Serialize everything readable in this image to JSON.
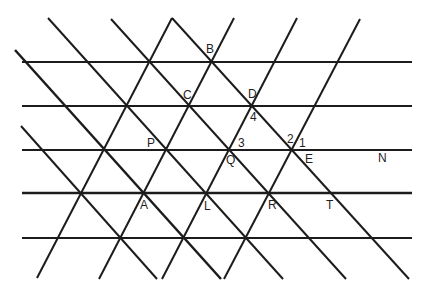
{
  "canvas": {
    "width": 428,
    "height": 297,
    "background": "#ffffff",
    "stroke_color": "#1c1c1c",
    "label_color": "#1e1e1e"
  },
  "diagram": {
    "horizontal_lines": [
      {
        "id": "row-0",
        "x1": 22,
        "y1": 62,
        "x2": 412,
        "y2": 62,
        "width": 2
      },
      {
        "id": "row-1",
        "x1": 22,
        "y1": 106,
        "x2": 412,
        "y2": 106,
        "width": 2
      },
      {
        "id": "row-2",
        "x1": 22,
        "y1": 150,
        "x2": 412,
        "y2": 150,
        "width": 2
      },
      {
        "id": "row-3",
        "x1": 22,
        "y1": 193,
        "x2": 412,
        "y2": 193,
        "width": 2.6
      },
      {
        "id": "row-4",
        "x1": 22,
        "y1": 238,
        "x2": 412,
        "y2": 238,
        "width": 2
      }
    ],
    "descending_lines": [
      {
        "id": "desc-0",
        "x1": 21,
        "y1": 126,
        "x2": 157,
        "y2": 279,
        "width": 2
      },
      {
        "id": "desc-1",
        "x1": 15,
        "y1": 50,
        "x2": 221,
        "y2": 279,
        "width": 2.5
      },
      {
        "id": "desc-2",
        "x1": 48,
        "y1": 18,
        "x2": 283,
        "y2": 279,
        "width": 2
      },
      {
        "id": "desc-3",
        "x1": 111,
        "y1": 19,
        "x2": 346,
        "y2": 279,
        "width": 2
      },
      {
        "id": "desc-4",
        "x1": 172,
        "y1": 18,
        "x2": 409,
        "y2": 279,
        "width": 2
      }
    ],
    "ascending_lines": [
      {
        "id": "asc-0",
        "x1": 172,
        "y1": 18,
        "x2": 37,
        "y2": 278,
        "width": 2
      },
      {
        "id": "asc-1",
        "x1": 234,
        "y1": 18,
        "x2": 99,
        "y2": 279,
        "width": 2
      },
      {
        "id": "asc-2",
        "x1": 297,
        "y1": 18,
        "x2": 162,
        "y2": 279,
        "width": 2
      },
      {
        "id": "asc-3",
        "x1": 360,
        "y1": 19,
        "x2": 224,
        "y2": 279,
        "width": 2
      }
    ],
    "labels": [
      {
        "text": "B",
        "x": 206,
        "y": 53
      },
      {
        "text": "C",
        "x": 183,
        "y": 99
      },
      {
        "text": "D",
        "x": 248,
        "y": 98
      },
      {
        "text": "4",
        "x": 250,
        "y": 121
      },
      {
        "text": "P",
        "x": 147,
        "y": 147
      },
      {
        "text": "3",
        "x": 238,
        "y": 147
      },
      {
        "text": "Q",
        "x": 226,
        "y": 164
      },
      {
        "text": "2",
        "x": 287,
        "y": 143
      },
      {
        "text": "1",
        "x": 299,
        "y": 147
      },
      {
        "text": "E",
        "x": 305,
        "y": 163
      },
      {
        "text": "N",
        "x": 378,
        "y": 162
      },
      {
        "text": "A",
        "x": 140,
        "y": 209
      },
      {
        "text": "L",
        "x": 204,
        "y": 210
      },
      {
        "text": "R",
        "x": 268,
        "y": 209
      },
      {
        "text": "T",
        "x": 326,
        "y": 209
      }
    ]
  }
}
